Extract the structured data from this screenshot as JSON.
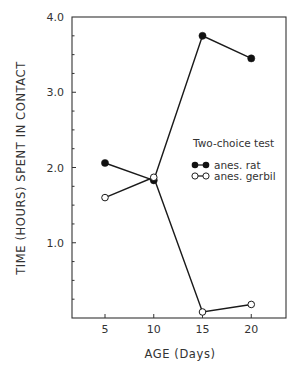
{
  "chart_data": {
    "type": "line",
    "title": "",
    "xlabel": "AGE (Days)",
    "ylabel": "TIME (HOURS) SPENT IN CONTACT",
    "x": [
      5,
      10,
      15,
      20
    ],
    "x_tick_labels": [
      "5",
      "10",
      "15",
      "20"
    ],
    "y_tick_labels": [
      "1.0",
      "2.0",
      "3.0",
      "4.0"
    ],
    "y_ticks": [
      1.0,
      2.0,
      3.0,
      4.0
    ],
    "xlim": [
      1.7,
      23.5
    ],
    "ylim": [
      0,
      4.0
    ],
    "grid": false,
    "legend": {
      "title": "Two-choice test",
      "position": "right-middle inside plot"
    },
    "series": [
      {
        "name": "anes. rat",
        "marker": "filled-circle",
        "values": [
          2.06,
          1.83,
          3.75,
          3.45
        ]
      },
      {
        "name": "anes. gerbil",
        "marker": "open-circle",
        "values": [
          1.6,
          1.87,
          0.08,
          0.18
        ]
      }
    ]
  }
}
